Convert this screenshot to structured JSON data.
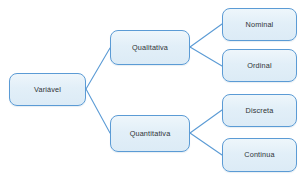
{
  "diagram": {
    "type": "tree",
    "background_color": "#ffffff",
    "node_fill_color": "#e2eff8",
    "node_border_color": "#5b9bd5",
    "connector_color": "#5b9bd5",
    "text_color": "#2f3437",
    "nodes": [
      {
        "id": "variavel",
        "label": "Variável",
        "level": 0
      },
      {
        "id": "qualitativa",
        "label": "Qualitativa",
        "level": 1
      },
      {
        "id": "quantitativa",
        "label": "Quantitativa",
        "level": 1
      },
      {
        "id": "nominal",
        "label": "Nominal",
        "level": 2
      },
      {
        "id": "ordinal",
        "label": "Ordinal",
        "level": 2
      },
      {
        "id": "discreta",
        "label": "Discreta",
        "level": 2
      },
      {
        "id": "continua",
        "label": "Continua",
        "level": 2
      }
    ],
    "edges": [
      {
        "from": "variavel",
        "to": "qualitativa"
      },
      {
        "from": "variavel",
        "to": "quantitativa"
      },
      {
        "from": "qualitativa",
        "to": "nominal"
      },
      {
        "from": "qualitativa",
        "to": "ordinal"
      },
      {
        "from": "quantitativa",
        "to": "discreta"
      },
      {
        "from": "quantitativa",
        "to": "continua"
      }
    ]
  }
}
